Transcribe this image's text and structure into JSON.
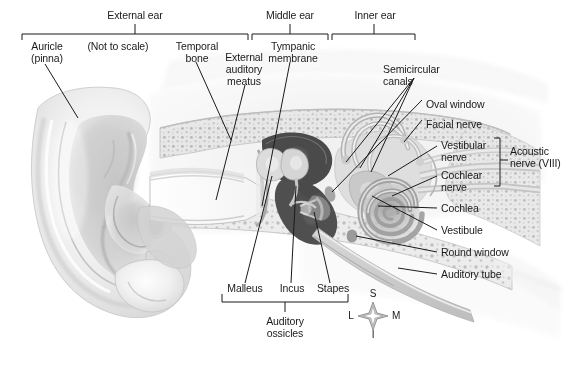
{
  "figure": {
    "background_color": "#ffffff",
    "text_color": "#1a1a1a",
    "line_color": "#1a1a1a"
  },
  "region_brackets": [
    {
      "label": "External ear",
      "x1": 22,
      "x2": 248,
      "label_x": 135,
      "label_y": 16
    },
    {
      "label": "Middle ear",
      "x1": 252,
      "x2": 328,
      "label_x": 290,
      "label_y": 16
    },
    {
      "label": "Inner ear",
      "x1": 332,
      "x2": 415,
      "label_x": 374,
      "label_y": 16
    }
  ],
  "notes": {
    "scale_note": "(Not to scale)"
  },
  "labels_top": [
    {
      "name": "auricle",
      "line1": "Auricle",
      "line2": "(pinna)",
      "x": 46,
      "y": 46
    },
    {
      "name": "not-to-scale",
      "line1": "(Not to scale)",
      "line2": "",
      "x": 117,
      "y": 46
    },
    {
      "name": "temporal-bone",
      "line1": "Temporal",
      "line2": "bone",
      "x": 196,
      "y": 46
    },
    {
      "name": "external-auditory-meatus",
      "line1": "External",
      "line2": "auditory",
      "line3": "meatus",
      "x": 241,
      "y": 57
    },
    {
      "name": "tympanic-membrane",
      "line1": "Tympanic",
      "line2": "membrane",
      "x": 293,
      "y": 46
    },
    {
      "name": "semicircular-canals",
      "line1": "Semicircular",
      "line2": "canals",
      "x": 417,
      "y": 70
    }
  ],
  "labels_right": [
    {
      "name": "oval-window",
      "text": "Oval window",
      "x": 425,
      "y": 101
    },
    {
      "name": "facial-nerve",
      "text": "Facial nerve",
      "x": 425,
      "y": 121
    },
    {
      "name": "vestibular-nerve",
      "line1": "Vestibular",
      "line2": "nerve",
      "x": 440,
      "y": 142
    },
    {
      "name": "cochlear-nerve",
      "line1": "Cochlear",
      "line2": "nerve",
      "x": 440,
      "y": 172
    },
    {
      "name": "cochlea",
      "text": "Cochlea",
      "x": 440,
      "y": 208
    },
    {
      "name": "vestibule",
      "text": "Vestibule",
      "x": 440,
      "y": 230
    },
    {
      "name": "round-window",
      "text": "Round window",
      "x": 440,
      "y": 252
    },
    {
      "name": "auditory-tube",
      "text": "Auditory tube",
      "x": 440,
      "y": 274
    }
  ],
  "acoustic_nerve": {
    "line1": "Acoustic",
    "line2": "nerve (VIII)",
    "label_x": 512,
    "label_y": 152,
    "bracket_x": 500,
    "bracket_top": 138,
    "bracket_bottom": 186
  },
  "labels_bottom": [
    {
      "name": "malleus",
      "text": "Malleus",
      "x": 245,
      "y": 288
    },
    {
      "name": "incus",
      "text": "Incus",
      "x": 291,
      "y": 288
    },
    {
      "name": "stapes",
      "text": "Stapes",
      "x": 326,
      "y": 288
    }
  ],
  "ossicles_bracket": {
    "label_line1": "Auditory",
    "label_line2": "ossicles",
    "x1": 222,
    "x2": 348,
    "y": 302,
    "label_x": 285,
    "label_y": 320
  },
  "compass": {
    "name": "orientation-compass",
    "center_x": 373,
    "center_y": 315,
    "superior": "S",
    "inferior": "I",
    "lateral": "L",
    "medial": "M"
  }
}
